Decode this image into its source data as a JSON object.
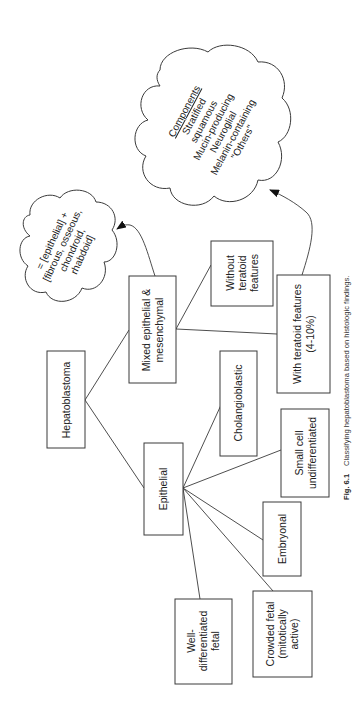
{
  "figure": {
    "orientation": "rotated-90-clockwise",
    "caption": {
      "label": "Fig. 6.1",
      "text": "Classifying hepatoblastoma based on histologic findings."
    }
  },
  "nodes": {
    "root": {
      "lines": [
        "Hepatoblastoma"
      ]
    },
    "mixed": {
      "lines": [
        "Mixed epithelial &",
        "mesenchymal"
      ]
    },
    "epithelial": {
      "lines": [
        "Epithelial"
      ]
    },
    "without_teratoid": {
      "lines": [
        "Without",
        "teratoid",
        "features"
      ]
    },
    "with_teratoid": {
      "lines": [
        "With teratoid features",
        "(4-10%)"
      ]
    },
    "cholangioblastic": {
      "lines": [
        "Cholangioblastic"
      ]
    },
    "small_cell": {
      "lines": [
        "Small cell",
        "undifferentiated"
      ]
    },
    "embryonal": {
      "lines": [
        "Embryonal"
      ]
    },
    "crowded_fetal": {
      "lines": [
        "Crowded fetal",
        "(mitotically",
        "active)"
      ]
    },
    "well_diff_fetal": {
      "lines": [
        "Well-",
        "differentiated",
        "fetal"
      ]
    }
  },
  "clouds": {
    "mixed_definition": {
      "lines": [
        "= [epithelial] +",
        "[fibrous, osseous,",
        "chondroid,",
        "rhabdoid]"
      ]
    },
    "components": {
      "heading": "Components",
      "lines": [
        "Stratified",
        "squamous",
        "Mucin-producing",
        "Neuroglial",
        "Melanin-containing",
        "\"Others\""
      ]
    }
  },
  "edges": [
    [
      "root",
      "mixed"
    ],
    [
      "root",
      "epithelial"
    ],
    [
      "mixed",
      "without_teratoid"
    ],
    [
      "mixed",
      "with_teratoid"
    ],
    [
      "epithelial",
      "cholangioblastic"
    ],
    [
      "epithelial",
      "small_cell"
    ],
    [
      "epithelial",
      "embryonal"
    ],
    [
      "epithelial",
      "crowded_fetal"
    ],
    [
      "epithelial",
      "well_diff_fetal"
    ],
    [
      "mixed",
      "mixed_definition"
    ],
    [
      "with_teratoid",
      "components"
    ]
  ],
  "colors": {
    "line": "#3a3a3a",
    "text": "#222222",
    "background": "#ffffff"
  }
}
